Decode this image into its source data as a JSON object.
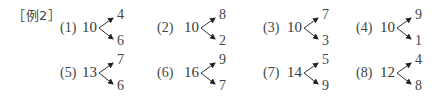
{
  "example_label": "［例2］",
  "items": [
    {
      "index": "(1)",
      "total": "10",
      "top": "4",
      "bottom": "6"
    },
    {
      "index": "(2)",
      "total": "10",
      "top": "8",
      "bottom": "2"
    },
    {
      "index": "(3)",
      "total": "10",
      "top": "7",
      "bottom": "3"
    },
    {
      "index": "(4)",
      "total": "10",
      "top": "9",
      "bottom": "1"
    },
    {
      "index": "(5)",
      "total": "13",
      "top": "7",
      "bottom": "6"
    },
    {
      "index": "(6)",
      "total": "16",
      "top": "9",
      "bottom": "7"
    },
    {
      "index": "(7)",
      "total": "14",
      "top": "5",
      "bottom": "9"
    },
    {
      "index": "(8)",
      "total": "12",
      "top": "4",
      "bottom": "8"
    }
  ]
}
